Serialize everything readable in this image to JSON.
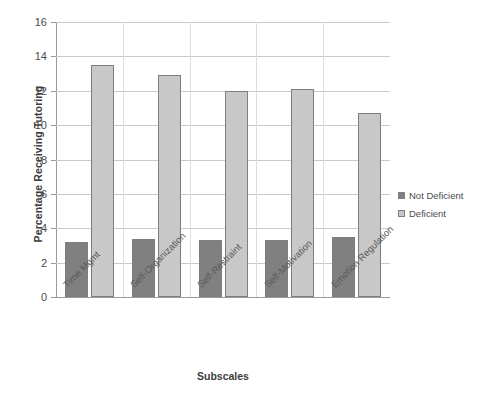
{
  "chart_data": {
    "type": "bar",
    "title": "",
    "xlabel": "Subscales",
    "ylabel": "Percentage Receiving Tutoring",
    "categories": [
      "Time Mgmt",
      "Self-Organization",
      "Self-Restraint",
      "Self-Motivation",
      "Emotion Regulation"
    ],
    "series": [
      {
        "name": "Not Deficient",
        "color": "#808080",
        "values": [
          3.2,
          3.4,
          3.3,
          3.3,
          3.5
        ]
      },
      {
        "name": "Deficient",
        "color": "#c8c8c8",
        "values": [
          13.5,
          12.9,
          12.0,
          12.1,
          10.7
        ]
      }
    ],
    "ylim": [
      0,
      16
    ],
    "ytick_labels": [
      "16",
      "14",
      "12",
      "10",
      "8",
      "6",
      "4",
      "2",
      "0"
    ],
    "ytick_values": [
      16,
      14,
      12,
      10,
      8,
      6,
      4,
      2,
      0
    ],
    "grid": "horizontal",
    "legend_position": "right",
    "axis_color": "#9a9a9a",
    "grid_color": "#c9c9c9",
    "bar_edge_color": "#7e7e7e",
    "background": "#ffffff"
  },
  "legend": {
    "items": [
      {
        "label": "Not Deficient",
        "color": "#808080"
      },
      {
        "label": "Deficient",
        "color": "#c8c8c8"
      }
    ]
  }
}
